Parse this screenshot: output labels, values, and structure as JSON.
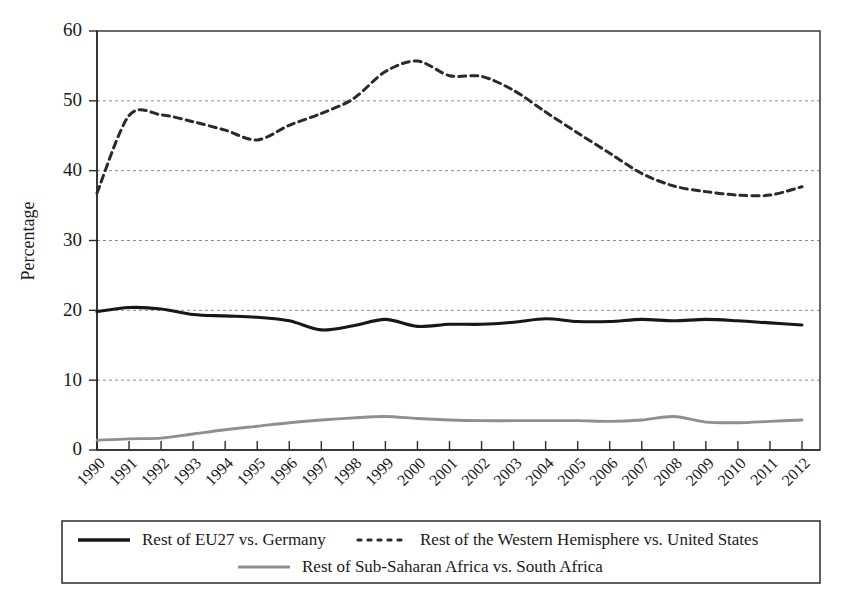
{
  "chart_data": {
    "type": "line",
    "title": "",
    "xlabel": "",
    "ylabel": "Percentage",
    "ylim": [
      0,
      60
    ],
    "ytick_step": 10,
    "yticks": [
      "0",
      "10",
      "20",
      "30",
      "40",
      "50",
      "60"
    ],
    "grid": true,
    "legend_position": "below",
    "categories": [
      "1990",
      "1991",
      "1992",
      "1993",
      "1994",
      "1995",
      "1996",
      "1997",
      "1998",
      "1999",
      "2000",
      "2001",
      "2002",
      "2003",
      "2004",
      "2005",
      "2006",
      "2007",
      "2008",
      "2009",
      "2010",
      "2011",
      "2012"
    ],
    "series": [
      {
        "name": "Rest of EU27  vs. Germany",
        "style": "solid-black",
        "color": "#171717",
        "values": [
          19.8,
          20.4,
          20.2,
          19.4,
          19.2,
          19.0,
          18.5,
          17.2,
          17.8,
          18.7,
          17.7,
          18.0,
          18.0,
          18.3,
          18.8,
          18.4,
          18.4,
          18.7,
          18.5,
          18.7,
          18.5,
          18.2,
          17.9
        ]
      },
      {
        "name": "Rest of the Western Hemisphere vs. United States",
        "style": "dotted-black",
        "color": "#2a2a2a",
        "values": [
          36.8,
          47.9,
          48.0,
          47.0,
          45.8,
          44.4,
          46.5,
          48.2,
          50.3,
          54.2,
          55.7,
          53.6,
          53.5,
          51.5,
          48.4,
          45.4,
          42.5,
          39.6,
          37.8,
          37.0,
          36.5,
          36.5,
          37.7
        ]
      },
      {
        "name": "Rest of Sub-Saharan Africa vs. South Africa",
        "style": "solid-gray",
        "color": "#8f8f8f",
        "values": [
          1.4,
          1.6,
          1.7,
          2.3,
          2.9,
          3.4,
          3.9,
          4.3,
          4.6,
          4.8,
          4.5,
          4.3,
          4.2,
          4.2,
          4.2,
          4.2,
          4.1,
          4.3,
          4.8,
          4.0,
          3.9,
          4.1,
          4.3
        ]
      }
    ]
  },
  "legend": {
    "entries": [
      {
        "label": "Rest of EU27  vs. Germany",
        "style": "solid-black"
      },
      {
        "label": "Rest of the Western Hemisphere vs. United States",
        "style": "dotted-black"
      },
      {
        "label": "Rest of Sub-Saharan Africa vs. South Africa",
        "style": "solid-gray"
      }
    ]
  }
}
